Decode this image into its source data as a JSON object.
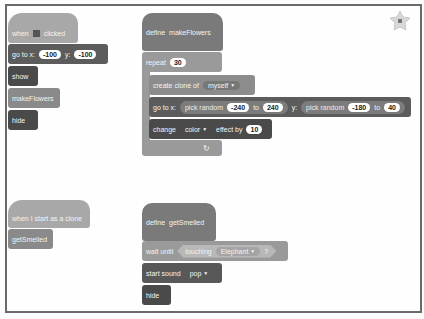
{
  "workspace": {
    "stack1": {
      "hat": {
        "when": "when",
        "icon": "green-flag-icon",
        "clicked": "clicked"
      },
      "goto": {
        "label_x": "go to x:",
        "x": "-100",
        "label_y": "y:",
        "y": "-100"
      },
      "show": "show",
      "call": "makeFlowers",
      "hide": "hide"
    },
    "stack2": {
      "define": {
        "label": "define",
        "name": "makeFlowers"
      },
      "repeat": {
        "label": "repeat",
        "count": "30"
      },
      "create_clone": {
        "label": "create clone of",
        "target": "myself"
      },
      "goto": {
        "label_x": "go to x:",
        "rand1": "pick random",
        "x_from": "-240",
        "to1": "to",
        "x_to": "240",
        "label_y": "y:",
        "rand2": "pick random",
        "y_from": "-180",
        "to2": "to",
        "y_to": "40"
      },
      "change_effect": {
        "label": "change",
        "effect": "color",
        "by": "effect by",
        "value": "10"
      },
      "loop_arrow": "↻"
    },
    "stack3": {
      "hat": "when I start as a clone",
      "call": "getSmelled"
    },
    "stack4": {
      "define": {
        "label": "define",
        "name": "getSmelled"
      },
      "wait_until": {
        "label": "wait until",
        "touching": "touching",
        "target": "Elephant",
        "q": "?"
      },
      "start_sound": {
        "label": "start sound",
        "sound": "pop"
      },
      "hide": "hide"
    }
  },
  "stage_button": {
    "icon": "add-sprite-icon"
  }
}
